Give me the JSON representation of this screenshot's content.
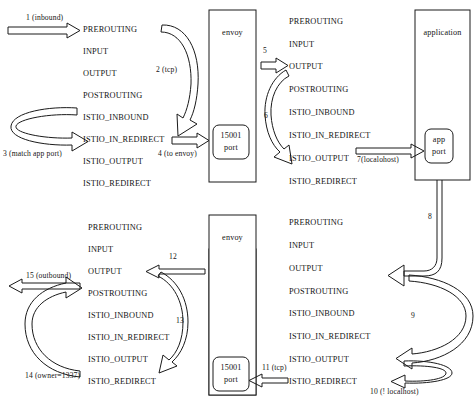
{
  "diagram": {
    "chain_names": [
      "PREROUTING",
      "INPUT",
      "OUTPUT",
      "POSTROUTING",
      "ISTIO_INBOUND",
      "ISTIO_IN_REDIRECT",
      "ISTIO_OUTPUT",
      "ISTIO_REDIRECT"
    ],
    "columns": [
      {
        "id": "col-top-left",
        "chains": [
          "PREROUTING",
          "INPUT",
          "OUTPUT",
          "POSTROUTING",
          "ISTIO_INBOUND",
          "ISTIO_IN_REDIRECT",
          "ISTIO_OUTPUT",
          "ISTIO_REDIRECT"
        ]
      },
      {
        "id": "col-top-right",
        "chains": [
          "PREROUTING",
          "INPUT",
          "OUTPUT",
          "POSTROUTING",
          "ISTIO_INBOUND",
          "ISTIO_IN_REDIRECT",
          "ISTIO_OUTPUT",
          "ISTIO_REDIRECT"
        ]
      },
      {
        "id": "col-bottom-left",
        "chains": [
          "PREROUTING",
          "INPUT",
          "OUTPUT",
          "POSTROUTING",
          "ISTIO_INBOUND",
          "ISTIO_IN_REDIRECT",
          "ISTIO_OUTPUT",
          "ISTIO_REDIRECT"
        ]
      },
      {
        "id": "col-bottom-right",
        "chains": [
          "PREROUTING",
          "INPUT",
          "OUTPUT",
          "POSTROUTING",
          "ISTIO_INBOUND",
          "ISTIO_IN_REDIRECT",
          "ISTIO_OUTPUT",
          "ISTIO_REDIRECT"
        ]
      }
    ],
    "boxes": [
      {
        "id": "envoy-top",
        "label": "envoy",
        "port_label_line1": "15001",
        "port_label_line2": "port"
      },
      {
        "id": "application",
        "label": "application",
        "port_label_line1": "app",
        "port_label_line2": "port"
      },
      {
        "id": "envoy-bottom",
        "label": "envoy",
        "port_label_line1": "15001",
        "port_label_line2": "port"
      }
    ],
    "steps": [
      {
        "n": "1",
        "label": "1 (inbound)"
      },
      {
        "n": "2",
        "label": "2 (tcp)"
      },
      {
        "n": "3",
        "label": "3 (match app port)"
      },
      {
        "n": "4",
        "label": "4 (to envoy)"
      },
      {
        "n": "5",
        "label": "5"
      },
      {
        "n": "6",
        "label": "6"
      },
      {
        "n": "7",
        "label": "7(localohost)"
      },
      {
        "n": "8",
        "label": "8"
      },
      {
        "n": "9",
        "label": "9"
      },
      {
        "n": "10",
        "label": "10 (! localhost)"
      },
      {
        "n": "11",
        "label": "11 (tcp)"
      },
      {
        "n": "12",
        "label": "12"
      },
      {
        "n": "13",
        "label": "13"
      },
      {
        "n": "14",
        "label": "14 (owner=1337)"
      },
      {
        "n": "15",
        "label": "15 (outbound)"
      }
    ],
    "colors": {
      "stroke": "#1a1a1a",
      "background": "#ffffff",
      "text": "#141414"
    }
  }
}
